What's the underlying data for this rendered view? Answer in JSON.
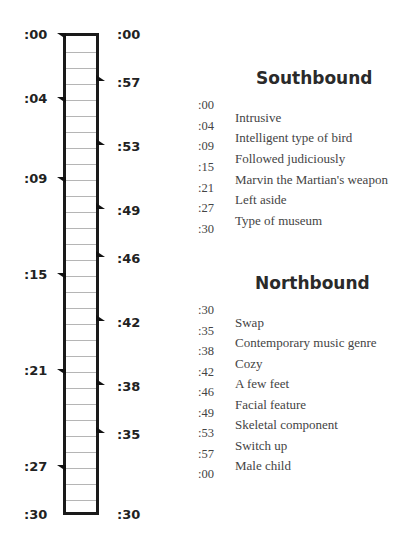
{
  "diagram": {
    "type": "train-schedule-ladder",
    "scale_minutes": 30,
    "left_labels": [
      {
        "label": ":00",
        "minute": 0
      },
      {
        "label": ":04",
        "minute": 4
      },
      {
        "label": ":09",
        "minute": 9
      },
      {
        "label": ":15",
        "minute": 15
      },
      {
        "label": ":21",
        "minute": 21
      },
      {
        "label": ":27",
        "minute": 27
      },
      {
        "label": ":30",
        "minute": 30
      }
    ],
    "right_labels": [
      {
        "label": ":00",
        "minute": 0
      },
      {
        "label": ":57",
        "minute": 3
      },
      {
        "label": ":53",
        "minute": 7
      },
      {
        "label": ":49",
        "minute": 11
      },
      {
        "label": ":46",
        "minute": 14
      },
      {
        "label": ":42",
        "minute": 18
      },
      {
        "label": ":38",
        "minute": 22
      },
      {
        "label": ":35",
        "minute": 25
      },
      {
        "label": ":30",
        "minute": 30
      }
    ]
  },
  "southbound": {
    "title": "Southbound",
    "times": [
      ":00",
      ":04",
      ":09",
      ":15",
      ":21",
      ":27",
      ":30"
    ],
    "clues": [
      "Intrusive",
      "Intelligent type of bird",
      "Followed judiciously",
      "Marvin the Martian's weapon",
      "Left aside",
      "Type of museum"
    ]
  },
  "northbound": {
    "title": "Northbound",
    "times": [
      ":30",
      ":35",
      ":38",
      ":42",
      ":46",
      ":49",
      ":53",
      ":57",
      ":00"
    ],
    "clues": [
      "Swap",
      "Contemporary music genre",
      "Cozy",
      "A few feet",
      "Facial feature",
      "Skeletal component",
      "Switch up",
      "Male child"
    ]
  }
}
